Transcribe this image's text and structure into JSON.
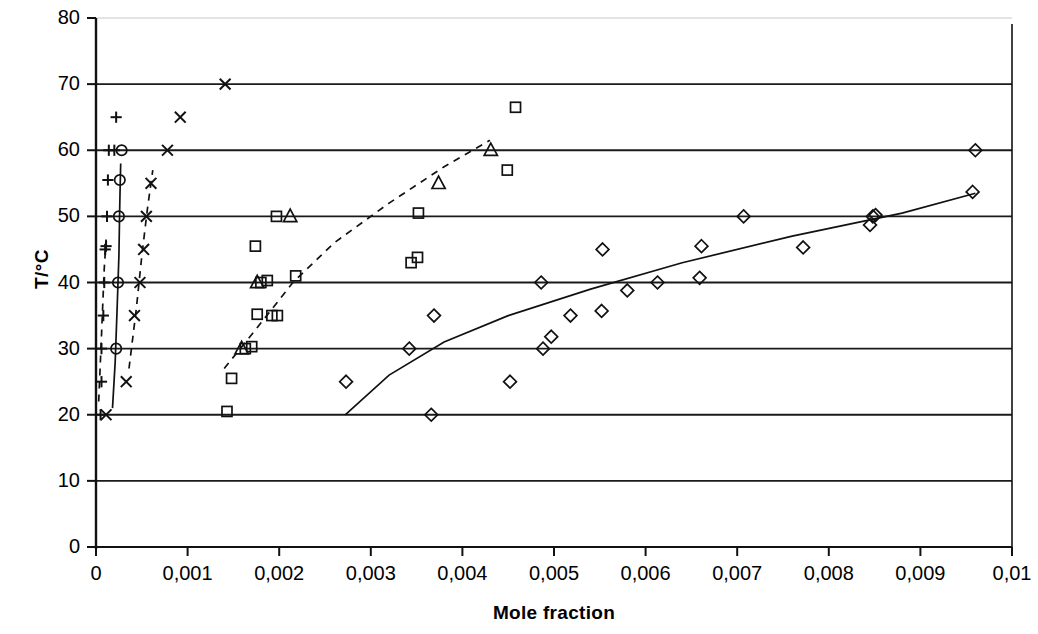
{
  "chart_data": {
    "type": "scatter",
    "title": "",
    "xlabel": "Mole fraction",
    "ylabel": "T/°C",
    "xlim": [
      0,
      0.01
    ],
    "ylim": [
      0,
      80
    ],
    "grid": "horizontal",
    "legend": "none",
    "decimal_separator": ",",
    "x_ticks": [
      {
        "value": 0,
        "label": "0"
      },
      {
        "value": 0.001,
        "label": "0,001"
      },
      {
        "value": 0.002,
        "label": "0,002"
      },
      {
        "value": 0.003,
        "label": "0,003"
      },
      {
        "value": 0.004,
        "label": "0,004"
      },
      {
        "value": 0.005,
        "label": "0,005"
      },
      {
        "value": 0.006,
        "label": "0,006"
      },
      {
        "value": 0.007,
        "label": "0,007"
      },
      {
        "value": 0.008,
        "label": "0,008"
      },
      {
        "value": 0.009,
        "label": "0,009"
      },
      {
        "value": 0.01,
        "label": "0,01"
      }
    ],
    "y_ticks": [
      {
        "value": 0,
        "label": "0"
      },
      {
        "value": 10,
        "label": "10"
      },
      {
        "value": 20,
        "label": "20"
      },
      {
        "value": 30,
        "label": "30"
      },
      {
        "value": 40,
        "label": "40"
      },
      {
        "value": 50,
        "label": "50"
      },
      {
        "value": 60,
        "label": "60"
      },
      {
        "value": 70,
        "label": "70"
      },
      {
        "value": 80,
        "label": "80"
      }
    ],
    "series": [
      {
        "name": "series-plus",
        "marker": "plus",
        "points": [
          [
            5e-05,
            20.0
          ],
          [
            6e-05,
            25.0
          ],
          [
            6e-05,
            30.0
          ],
          [
            8e-05,
            35.0
          ],
          [
            9e-05,
            40.0
          ],
          [
            0.0001,
            45.0
          ],
          [
            0.00011,
            45.5
          ],
          [
            0.00012,
            50.0
          ],
          [
            0.00013,
            55.5
          ],
          [
            0.00014,
            60.0
          ],
          [
            0.0002,
            60.0
          ],
          [
            0.00022,
            65.0
          ]
        ]
      },
      {
        "name": "series-circle",
        "marker": "circle",
        "points": [
          [
            0.00022,
            30.0
          ],
          [
            0.00024,
            40.0
          ],
          [
            0.00025,
            50.0
          ],
          [
            0.00026,
            55.5
          ],
          [
            0.00028,
            60.0
          ]
        ]
      },
      {
        "name": "series-cross",
        "marker": "cross",
        "points": [
          [
            0.00011,
            20.0
          ],
          [
            0.00033,
            25.0
          ],
          [
            0.00042,
            35.0
          ],
          [
            0.00048,
            40.0
          ],
          [
            0.00052,
            45.0
          ],
          [
            0.00055,
            50.0
          ],
          [
            0.0006,
            55.0
          ],
          [
            0.00078,
            60.0
          ],
          [
            0.00092,
            65.0
          ],
          [
            0.00141,
            70.0
          ]
        ]
      },
      {
        "name": "series-square",
        "marker": "square",
        "points": [
          [
            0.00143,
            20.5
          ],
          [
            0.00148,
            25.5
          ],
          [
            0.00163,
            30.0
          ],
          [
            0.0017,
            30.3
          ],
          [
            0.00176,
            35.2
          ],
          [
            0.00192,
            35.0
          ],
          [
            0.00198,
            35.0
          ],
          [
            0.0018,
            40.0
          ],
          [
            0.00187,
            40.3
          ],
          [
            0.00218,
            41.0
          ],
          [
            0.00174,
            45.5
          ],
          [
            0.00197,
            50.0
          ],
          [
            0.00344,
            43.0
          ],
          [
            0.00351,
            43.8
          ],
          [
            0.00352,
            50.5
          ],
          [
            0.00449,
            57.0
          ],
          [
            0.00458,
            66.5
          ]
        ]
      },
      {
        "name": "series-triangle",
        "marker": "triangle",
        "points": [
          [
            0.00159,
            30.0
          ],
          [
            0.00176,
            40.0
          ],
          [
            0.00212,
            50.0
          ],
          [
            0.00374,
            55.0
          ],
          [
            0.00431,
            60.0
          ]
        ]
      },
      {
        "name": "series-diamond",
        "marker": "diamond",
        "points": [
          [
            0.00273,
            25.0
          ],
          [
            0.00342,
            30.0
          ],
          [
            0.00366,
            20.0
          ],
          [
            0.00369,
            35.0
          ],
          [
            0.00452,
            25.0
          ],
          [
            0.00488,
            30.0
          ],
          [
            0.00497,
            31.8
          ],
          [
            0.00486,
            40.0
          ],
          [
            0.00518,
            35.0
          ],
          [
            0.00552,
            35.7
          ],
          [
            0.00553,
            45.0
          ],
          [
            0.0058,
            38.8
          ],
          [
            0.00613,
            40.0
          ],
          [
            0.00659,
            40.7
          ],
          [
            0.00661,
            45.5
          ],
          [
            0.00707,
            50.0
          ],
          [
            0.00772,
            45.3
          ],
          [
            0.00845,
            48.7
          ],
          [
            0.00848,
            50.0
          ],
          [
            0.00851,
            50.2
          ],
          [
            0.00957,
            53.7
          ],
          [
            0.0096,
            60.0
          ]
        ]
      }
    ],
    "fit_curves": [
      {
        "name": "fit-plus-dashed",
        "style": "dashed",
        "points": [
          [
            3e-05,
            22.0
          ],
          [
            6e-05,
            32.0
          ],
          [
            9e-05,
            42.0
          ],
          [
            0.00011,
            46.5
          ]
        ]
      },
      {
        "name": "fit-circle-solid",
        "style": "solid",
        "points": [
          [
            0.00018,
            21.0
          ],
          [
            0.00021,
            28.0
          ],
          [
            0.00023,
            36.0
          ],
          [
            0.00025,
            44.0
          ],
          [
            0.00026,
            52.0
          ],
          [
            0.00027,
            58.0
          ]
        ]
      },
      {
        "name": "fit-cross-dashed",
        "style": "dashed",
        "points": [
          [
            0.00036,
            27.0
          ],
          [
            0.00044,
            36.0
          ],
          [
            0.0005,
            44.0
          ],
          [
            0.00056,
            51.0
          ],
          [
            0.00062,
            57.0
          ]
        ]
      },
      {
        "name": "fit-square-dashed",
        "style": "dashed",
        "points": [
          [
            0.0014,
            27.0
          ],
          [
            0.00175,
            33.0
          ],
          [
            0.00215,
            40.0
          ],
          [
            0.0026,
            46.0
          ],
          [
            0.0032,
            52.0
          ],
          [
            0.0038,
            57.5
          ],
          [
            0.0043,
            61.5
          ]
        ]
      },
      {
        "name": "fit-diamond-solid",
        "style": "solid",
        "points": [
          [
            0.00272,
            20.0
          ],
          [
            0.0032,
            26.0
          ],
          [
            0.0038,
            31.0
          ],
          [
            0.0045,
            35.0
          ],
          [
            0.0054,
            39.0
          ],
          [
            0.0064,
            43.0
          ],
          [
            0.0076,
            47.0
          ],
          [
            0.0088,
            50.5
          ],
          [
            0.0096,
            53.5
          ]
        ]
      }
    ]
  }
}
